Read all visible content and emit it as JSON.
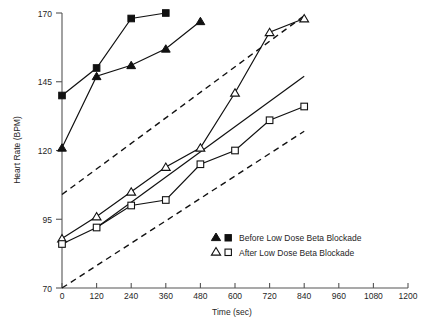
{
  "chart_data": {
    "type": "line",
    "title": "",
    "xlabel": "Time (sec)",
    "ylabel": "Heart Rate (BPM)",
    "xlim": [
      0,
      1200
    ],
    "ylim": [
      70,
      170
    ],
    "xticks": [
      0,
      120,
      240,
      360,
      480,
      600,
      720,
      840,
      960,
      1080,
      1200
    ],
    "yticks": [
      70,
      95,
      120,
      145,
      170
    ],
    "grid": false,
    "legend_position": "center-right",
    "series": [
      {
        "name": "Before Low Dose Beta Blockade (triangle)",
        "marker": "filled-triangle",
        "x": [
          0,
          120,
          240,
          360,
          480
        ],
        "y": [
          121,
          147,
          151,
          157,
          167
        ]
      },
      {
        "name": "Before Low Dose Beta Blockade (square)",
        "marker": "filled-square",
        "x": [
          0,
          120,
          240,
          360
        ],
        "y": [
          140,
          150,
          168,
          170
        ]
      },
      {
        "name": "After Low Dose Beta Blockade (triangle)",
        "marker": "open-triangle",
        "x": [
          0,
          120,
          240,
          360,
          480,
          600,
          720,
          840
        ],
        "y": [
          88,
          96,
          105,
          114,
          121,
          141,
          163,
          168
        ]
      },
      {
        "name": "After Low Dose Beta Blockade (square)",
        "marker": "open-square",
        "x": [
          0,
          120,
          240,
          360,
          480,
          600,
          720,
          840
        ],
        "y": [
          86,
          92,
          100,
          102,
          115,
          120,
          131,
          136
        ]
      }
    ],
    "reference_lines": [
      {
        "name": "upper-dashed-reference",
        "style": "dashed",
        "x": [
          0,
          840
        ],
        "y": [
          104,
          169
        ]
      },
      {
        "name": "lower-dashed-reference",
        "style": "dashed",
        "x": [
          0,
          840
        ],
        "y": [
          70,
          127
        ]
      },
      {
        "name": "middle-solid-reference",
        "style": "solid",
        "x": [
          120,
          840
        ],
        "y": [
          92,
          147
        ]
      }
    ],
    "legend_entries": [
      {
        "markers": [
          "filled-triangle",
          "filled-square"
        ],
        "label": "Before Low Dose Beta Blockade"
      },
      {
        "markers": [
          "open-triangle",
          "open-square"
        ],
        "label": "After Low Dose Beta Blockade"
      }
    ]
  },
  "axis": {
    "y_title": "Heart Rate (BPM)",
    "x_title": "Time (sec)",
    "y_tick_labels": [
      "170",
      "145",
      "120",
      "95",
      "70"
    ],
    "x_tick_labels": [
      "0",
      "120",
      "240",
      "360",
      "480",
      "600",
      "720",
      "840",
      "960",
      "1080",
      "1200"
    ]
  },
  "legend": {
    "row1_label": "Before Low Dose Beta Blockade",
    "row2_label": "After Low Dose Beta Blockade"
  },
  "colors": {
    "ink": "#111111",
    "axis": "#555555",
    "background": "#ffffff"
  }
}
